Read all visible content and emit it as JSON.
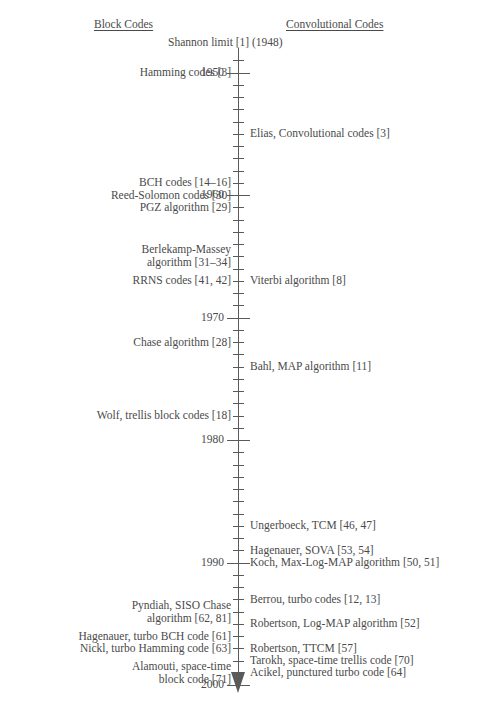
{
  "figure": {
    "headings": {
      "left": "Block Codes",
      "right": "Convolutional Codes"
    },
    "axis": {
      "start_year": 1948,
      "end_year": 2000,
      "year_labels": [
        "1950",
        "1960",
        "1970",
        "1980",
        "1990",
        "2000"
      ],
      "arrow_direction": "down"
    },
    "events_left": [
      {
        "label": "Hamming codes [3]",
        "year": 1950
      },
      {
        "label": "BCH codes [14–16]",
        "year": 1959
      },
      {
        "label": "Reed-Solomon codes [30]",
        "year": 1960
      },
      {
        "label": "PGZ algorithm [29]",
        "year": 1961
      },
      {
        "label": "Berlekamp-Massey\nalgorithm [31–34]",
        "year": 1965
      },
      {
        "label": "RRNS codes [41, 42]",
        "year": 1967
      },
      {
        "label": "Chase algorithm [28]",
        "year": 1972
      },
      {
        "label": "Wolf, trellis block codes [18]",
        "year": 1978
      },
      {
        "label": "Pyndiah, SISO Chase\nalgorithm [62, 81]",
        "year": 1994
      },
      {
        "label": "Hagenauer, turbo BCH code [61]",
        "year": 1996
      },
      {
        "label": "Nickl, turbo Hamming code [63]",
        "year": 1997
      },
      {
        "label": "Alamouti, space-time\nblock code [71]",
        "year": 1999
      }
    ],
    "events_right": [
      {
        "label": "Elias, Convolutional codes [3]",
        "year": 1955
      },
      {
        "label": "Viterbi algorithm [8]",
        "year": 1967
      },
      {
        "label": "Bahl, MAP algorithm [11]",
        "year": 1974
      },
      {
        "label": "Ungerboeck, TCM [46, 47]",
        "year": 1987
      },
      {
        "label": "Hagenauer, SOVA [53, 54]",
        "year": 1989
      },
      {
        "label": "Koch, Max-Log-MAP algorithm [50, 51]",
        "year": 1990
      },
      {
        "label": "Berrou, turbo codes [12, 13]",
        "year": 1993
      },
      {
        "label": "Robertson, Log-MAP algorithm [52]",
        "year": 1995
      },
      {
        "label": "Robertson, TTCM [57]",
        "year": 1997
      },
      {
        "label": "Tarokh, space-time trellis code [70]",
        "year": 1998
      },
      {
        "label": "Acikel, punctured turbo code [64]",
        "year": 1999
      }
    ],
    "top_annotation": {
      "label": "Shannon limit [1] (1948)"
    }
  }
}
